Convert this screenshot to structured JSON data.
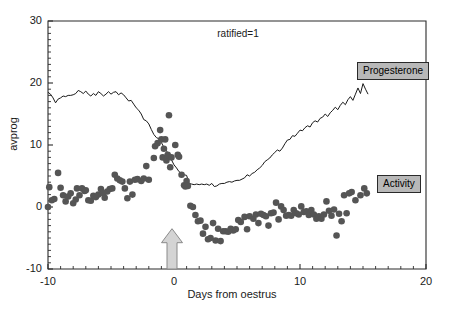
{
  "chart_data": {
    "type": "scatter",
    "title": "ratified=1",
    "xlabel": "Days from oestrus",
    "ylabel": "avprog",
    "xlim": [
      -10,
      20
    ],
    "ylim": [
      -10,
      30
    ],
    "xticks": [
      -10,
      0,
      10,
      20
    ],
    "xtick_labels": [
      "-10",
      "0",
      "10",
      "20"
    ],
    "yticks": [
      -10,
      0,
      10,
      20,
      30
    ],
    "ytick_labels": [
      "-10",
      "0",
      "10",
      "20",
      "30"
    ],
    "xminor_step": 1,
    "yminor_step": 1,
    "grid": false,
    "legend_position": "inside-right",
    "annotations": [
      {
        "name": "oestrus-arrow",
        "type": "up-arrow",
        "x": 0,
        "y_from": -10,
        "y_to": -3.5,
        "fill": "#d4d4d4",
        "stroke": "#8a8a8a"
      }
    ],
    "series": [
      {
        "name": "Progesterone",
        "type": "line",
        "color": "#1a1a1a",
        "x": [
          -10.0,
          -9.8,
          -9.6,
          -9.4,
          -9.2,
          -9.0,
          -8.8,
          -8.6,
          -8.4,
          -8.2,
          -8.0,
          -7.8,
          -7.6,
          -7.4,
          -7.2,
          -7.0,
          -6.8,
          -6.6,
          -6.4,
          -6.2,
          -6.0,
          -5.8,
          -5.6,
          -5.4,
          -5.2,
          -5.0,
          -4.8,
          -4.6,
          -4.4,
          -4.2,
          -4.0,
          -3.8,
          -3.6,
          -3.4,
          -3.2,
          -3.0,
          -2.8,
          -2.6,
          -2.4,
          -2.2,
          -2.0,
          -1.8,
          -1.6,
          -1.4,
          -1.2,
          -1.0,
          -0.8,
          -0.6,
          -0.4,
          -0.2,
          0.0,
          0.2,
          0.4,
          0.6,
          0.8,
          1.0,
          1.2,
          1.4,
          1.6,
          1.8,
          2.0,
          2.2,
          2.4,
          2.6,
          2.8,
          3.0,
          3.2,
          3.4,
          3.6,
          3.8,
          4.0,
          4.2,
          4.4,
          4.6,
          4.8,
          5.0,
          5.2,
          5.4,
          5.6,
          5.8,
          6.0,
          6.2,
          6.4,
          6.6,
          6.8,
          7.0,
          7.2,
          7.4,
          7.6,
          7.8,
          8.0,
          8.2,
          8.4,
          8.6,
          8.8,
          9.0,
          9.2,
          9.4,
          9.6,
          9.8,
          10.0,
          10.2,
          10.4,
          10.6,
          10.8,
          11.0,
          11.2,
          11.4,
          11.6,
          11.8,
          12.0,
          12.2,
          12.4,
          12.6,
          12.8,
          13.0,
          13.2,
          13.4,
          13.6,
          13.8,
          14.0,
          14.2,
          14.4,
          14.6,
          14.8,
          15.0,
          15.2,
          15.4
        ],
        "y": [
          18.5,
          18.2,
          17.6,
          16.8,
          17.4,
          17.6,
          17.9,
          17.8,
          18.0,
          18.0,
          18.1,
          18.3,
          18.8,
          18.6,
          18.3,
          18.7,
          18.2,
          17.9,
          18.3,
          18.0,
          18.6,
          18.3,
          17.9,
          18.2,
          18.6,
          18.2,
          18.5,
          18.6,
          18.1,
          18.4,
          18.1,
          17.6,
          17.1,
          17.2,
          16.6,
          16.0,
          15.6,
          15.0,
          14.1,
          13.9,
          13.4,
          12.5,
          11.7,
          11.2,
          11.0,
          10.4,
          9.6,
          9.1,
          8.3,
          7.6,
          6.8,
          6.3,
          5.7,
          5.4,
          5.2,
          5.1,
          3.8,
          3.7,
          3.6,
          3.7,
          3.6,
          3.7,
          3.6,
          3.7,
          3.5,
          3.8,
          3.3,
          3.4,
          3.7,
          3.8,
          3.8,
          4.0,
          4.1,
          4.0,
          4.2,
          4.3,
          4.3,
          4.5,
          4.7,
          5.2,
          5.0,
          5.4,
          5.6,
          6.0,
          6.3,
          6.7,
          7.3,
          7.6,
          7.9,
          8.4,
          8.8,
          9.2,
          9.0,
          9.5,
          10.2,
          10.8,
          10.9,
          11.5,
          11.4,
          11.9,
          12.4,
          12.3,
          12.8,
          13.1,
          12.9,
          13.6,
          13.9,
          13.7,
          14.3,
          14.5,
          15.0,
          14.6,
          15.2,
          15.6,
          16.1,
          15.7,
          16.4,
          16.9,
          16.5,
          17.3,
          17.8,
          17.2,
          18.2,
          19.2,
          18.3,
          19.9,
          19.0,
          18.2
        ]
      },
      {
        "name": "Activity",
        "type": "scatter",
        "color": "#555555",
        "marker": "circle",
        "marker_size": 3.3,
        "x": [
          -10.0,
          -9.9,
          -9.7,
          -9.5,
          -9.2,
          -9.0,
          -8.8,
          -8.6,
          -8.4,
          -8.2,
          -8.0,
          -7.8,
          -7.7,
          -7.5,
          -7.3,
          -7.1,
          -7.0,
          -6.8,
          -6.6,
          -6.4,
          -6.2,
          -6.0,
          -5.8,
          -5.6,
          -5.5,
          -5.3,
          -5.1,
          -4.9,
          -4.7,
          -4.5,
          -4.3,
          -4.1,
          -3.9,
          -3.7,
          -3.5,
          -3.3,
          -3.1,
          -2.9,
          -2.6,
          -2.4,
          -2.2,
          -2.0,
          -1.6,
          -1.5,
          -1.3,
          -1.1,
          -1.0,
          -0.9,
          -0.8,
          -0.7,
          -0.6,
          -0.5,
          -0.4,
          -0.3,
          -0.2,
          0.1,
          0.3,
          0.4,
          0.6,
          0.8,
          0.9,
          1.0,
          1.1,
          1.3,
          1.5,
          1.7,
          1.9,
          2.1,
          2.3,
          2.5,
          2.7,
          2.9,
          3.1,
          3.3,
          3.5,
          3.7,
          3.9,
          4.1,
          4.3,
          4.5,
          4.7,
          4.9,
          5.1,
          5.3,
          5.6,
          5.8,
          6.0,
          6.3,
          6.5,
          6.7,
          6.9,
          7.1,
          7.3,
          7.5,
          7.7,
          7.9,
          8.1,
          8.3,
          8.5,
          8.7,
          8.9,
          9.1,
          9.3,
          9.5,
          9.7,
          9.9,
          10.1,
          10.3,
          10.5,
          10.7,
          10.9,
          11.1,
          11.3,
          11.5,
          11.7,
          11.9,
          12.1,
          12.3,
          12.5,
          12.7,
          12.9,
          13.1,
          13.3,
          13.5,
          13.7,
          13.9,
          14.1,
          14.4,
          14.8,
          15.1,
          15.3
        ],
        "y": [
          0.0,
          3.2,
          1.1,
          1.3,
          5.5,
          3.1,
          1.9,
          0.9,
          1.7,
          2.2,
          0.6,
          1.2,
          3.0,
          1.9,
          3.0,
          2.6,
          2.7,
          1.1,
          1.0,
          1.8,
          1.6,
          2.0,
          2.9,
          2.2,
          1.5,
          2.5,
          2.9,
          3.0,
          5.2,
          4.6,
          4.3,
          4.1,
          3.0,
          1.4,
          4.1,
          2.0,
          4.4,
          4.5,
          4.2,
          4.6,
          6.6,
          4.4,
          7.9,
          9.8,
          10.3,
          12.4,
          10.9,
          8.0,
          9.4,
          10.9,
          7.5,
          8.4,
          14.8,
          6.4,
          8.0,
          10.0,
          8.4,
          8.1,
          5.2,
          3.5,
          3.3,
          4.2,
          3.4,
          0.2,
          0.0,
          -1.3,
          -2.3,
          -2.2,
          -4.3,
          -3.2,
          -5.2,
          -5.0,
          -2.6,
          -5.4,
          -3.5,
          -5.5,
          -3.9,
          -3.9,
          -4.0,
          -3.5,
          -3.8,
          -3.6,
          -2.1,
          -2.4,
          -1.6,
          -3.6,
          -1.5,
          -1.9,
          -1.2,
          -2.6,
          -1.1,
          -1.3,
          -1.5,
          -3.0,
          -1.0,
          -0.9,
          0.7,
          -2.0,
          0.1,
          -0.5,
          -1.4,
          -1.3,
          -1.4,
          -0.5,
          -1.0,
          -1.2,
          0.1,
          -0.8,
          -0.7,
          -1.3,
          -0.5,
          -1.2,
          -1.9,
          -1.5,
          -1.9,
          -1.2,
          0.9,
          -0.6,
          -1.4,
          -0.4,
          -4.6,
          -1.1,
          -2.3,
          1.9,
          -1.0,
          2.2,
          2.4,
          1.1,
          1.9,
          3.0,
          2.2
        ]
      }
    ],
    "legend_items": [
      {
        "label": "Progesterone",
        "fill": "#b8b8b8",
        "border": "#2a2a2a"
      },
      {
        "label": "Activity",
        "fill": "#b8b8b8",
        "border": "#2a2a2a"
      }
    ]
  }
}
